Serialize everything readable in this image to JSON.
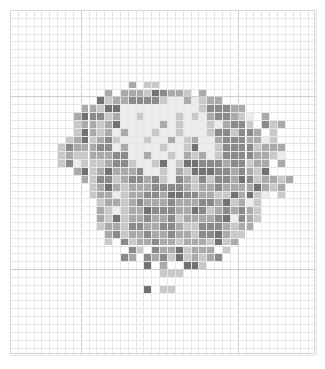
{
  "grid": {
    "cols": 39,
    "rows": 44,
    "cell_size": 7.85,
    "major_every": [
      9,
      29
    ],
    "major_rows": [
      11,
      33
    ],
    "colors": {
      "w": "#ececec",
      "l": "#c9c9c9",
      "m": "#aaaaaa",
      "d": "#8a8a8a",
      "D": "#727272",
      "line": "#e6e6e6",
      "major_line": "#cfcfcf"
    },
    "pattern": [
      ".......................................",
      ".......................................",
      ".......................................",
      ".......................................",
      ".......................................",
      ".......................................",
      ".......................................",
      ".......................................",
      ".......................................",
      "...............m.ll....................",
      "............m.mmmlDdmml.m..............",
      "...........Dlmmddddlwwmwlmm............",
      ".........mmlDDwwwwwwwwwwldddmm.........",
      "........mDddlmwwlwwwwlwlwmddmlw.m......",
      "........lmmlmDwwwwwmwlwwwlwmddl.dlm....",
      "........lDmlmwmwwwlwwlwwwlddlddm.l.....",
      ".......lmDlmdlwwwlwwmwlmwwmdddmmwl.....",
      "......ldmmmddwmwwwwlwwlDwwlddddlmmm....",
      "......lmllmmmddwwmwwlwmlmwlddddmmlw....",
      "......ldwlllmddlwwlDwlDDdddmddlmm.m....",
      "........mDlmDmmmdwwlwmlDDDddmdmlD......",
      ".........mlddlmddmdlwdmldlddmDdlmmlm...",
      "..........lmDmlmmmddddmlmmdmmmmDmlm....",
      "..........lmmwlmmddmDDddmmllDmDlw.l....",
      "...........lmmlmdmmmdmmmddmDlmwl.......",
      "...........mlwlmmDdddmmDdlmdmdml.......",
      "...........mlDlmmdmmdlmmmmdDwdml.......",
      "...........lmmlddmmddmlldddmlmm........",
      "............mdlmmdmmdmmlddDmll.........",
      "............l.dlmmdmmlmmmlDlm..........",
      "...............dl.dmmDlmmm.l...........",
      "..............dm.dmdlDlmlmd............",
      ".................D.m..DDl..............",
      "...................lll.................",
      ".......................................",
      ".................D.ll..................",
      ".......................................",
      ".......................................",
      ".......................................",
      ".......................................",
      ".......................................",
      ".......................................",
      ".......................................",
      "......................................."
    ]
  }
}
